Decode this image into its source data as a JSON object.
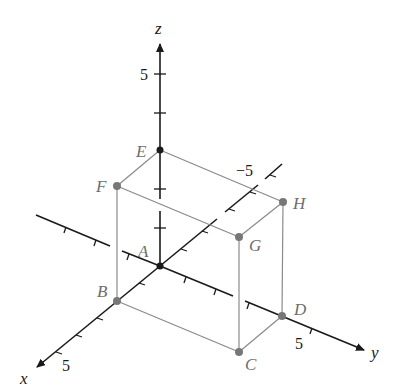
{
  "diagram": {
    "type": "3d-coordinate-box",
    "axes": {
      "x": {
        "label": "x",
        "tick_label": "5"
      },
      "y": {
        "label": "y",
        "tick_label": "5",
        "neg_tick_label": "−5"
      },
      "z": {
        "label": "z",
        "tick_label": "5"
      }
    },
    "points": [
      {
        "name": "A",
        "coords": [
          0,
          0,
          0
        ]
      },
      {
        "name": "B",
        "coords": [
          2,
          0,
          0
        ]
      },
      {
        "name": "C",
        "coords": [
          2,
          4,
          0
        ]
      },
      {
        "name": "D",
        "coords": [
          0,
          4,
          0
        ]
      },
      {
        "name": "E",
        "coords": [
          0,
          0,
          3
        ]
      },
      {
        "name": "F",
        "coords": [
          2,
          0,
          3
        ]
      },
      {
        "name": "G",
        "coords": [
          2,
          4,
          3
        ]
      },
      {
        "name": "H",
        "coords": [
          0,
          4,
          3
        ]
      }
    ],
    "labels": {
      "A": "A",
      "B": "B",
      "C": "C",
      "D": "D",
      "E": "E",
      "F": "F",
      "G": "G",
      "H": "H"
    },
    "colors": {
      "axis": "#1a1a1a",
      "edge": "#8a8a8a",
      "point": "#777777",
      "label": "#6d6d6d"
    }
  }
}
